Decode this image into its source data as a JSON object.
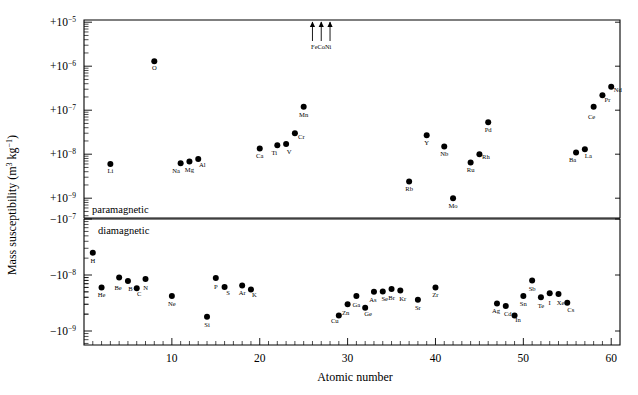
{
  "chart_data": {
    "type": "scatter",
    "title": "",
    "xlabel": "Atomic number",
    "ylabel": "Mass susceptibility (m^3 kg^-1)",
    "ylabel_parts": {
      "prefix": "Mass susceptibility (m",
      "sup1": "3",
      "mid": " kg",
      "sup2": "−1",
      "suffix": ")"
    },
    "xlim": [
      0,
      61
    ],
    "xticks": [
      10,
      20,
      30,
      40,
      50,
      60
    ],
    "xtick_labels": [
      "10",
      "20",
      "30",
      "40",
      "50",
      "60"
    ],
    "xminor_step": 1,
    "grid": false,
    "legend": null,
    "panels": [
      {
        "name": "paramagnetic",
        "label": "paramagnetic",
        "sign": "+",
        "yticks": [
          -5,
          -6,
          -7,
          -8,
          -9
        ],
        "ytick_labels": [
          "+10–5",
          "+10–6",
          "+10–7",
          "+10–8",
          "+10–9"
        ],
        "ytick_mantissas": [
          "+10",
          "+10",
          "+10",
          "+10",
          "+10"
        ],
        "ytick_exponents": [
          "−5",
          "−6",
          "−7",
          "−8",
          "−9"
        ],
        "ylim_log": [
          -9.45,
          -4.95
        ],
        "points": [
          {
            "label": "Li",
            "z": 3,
            "value": 6e-09,
            "lx": 0,
            "ly": 9
          },
          {
            "label": "O",
            "z": 8,
            "value": 1.3e-06,
            "lx": 0,
            "ly": 9
          },
          {
            "label": "Na",
            "z": 11,
            "value": 6.2e-09,
            "lx": -4.5,
            "ly": 10
          },
          {
            "label": "Mg",
            "z": 12,
            "value": 6.8e-09,
            "lx": 0,
            "ly": 10
          },
          {
            "label": "Al",
            "z": 13,
            "value": 7.8e-09,
            "lx": 4.0,
            "ly": 8
          },
          {
            "label": "Ca",
            "z": 20,
            "value": 1.35e-08,
            "lx": 0,
            "ly": 10
          },
          {
            "label": "Ti",
            "z": 22,
            "value": 1.6e-08,
            "lx": -3.0,
            "ly": 10
          },
          {
            "label": "V",
            "z": 23,
            "value": 1.7e-08,
            "lx": 3.0,
            "ly": 10
          },
          {
            "label": "Cr",
            "z": 24,
            "value": 3e-08,
            "lx": 6.5,
            "ly": 6
          },
          {
            "label": "Mn",
            "z": 25,
            "value": 1.2e-07,
            "lx": 0,
            "ly": 10
          },
          {
            "label": "Rb",
            "z": 37,
            "value": 2.4e-09,
            "lx": 0,
            "ly": 10
          },
          {
            "label": "Y",
            "z": 39,
            "value": 2.7e-08,
            "lx": 0,
            "ly": 10
          },
          {
            "label": "Nb",
            "z": 41,
            "value": 1.5e-08,
            "lx": 0,
            "ly": 10
          },
          {
            "label": "Mo",
            "z": 42,
            "value": 1e-09,
            "lx": 0,
            "ly": 10
          },
          {
            "label": "Ru",
            "z": 44,
            "value": 6.5e-09,
            "lx": 0,
            "ly": 10
          },
          {
            "label": "Rh",
            "z": 45,
            "value": 1e-08,
            "lx": 6.5,
            "ly": 5
          },
          {
            "label": "Pd",
            "z": 46,
            "value": 5.3e-08,
            "lx": 0,
            "ly": 10
          },
          {
            "label": "Ba",
            "z": 56,
            "value": 1.1e-08,
            "lx": -3.5,
            "ly": 10
          },
          {
            "label": "La",
            "z": 57,
            "value": 1.3e-08,
            "lx": 3.5,
            "ly": 9
          },
          {
            "label": "Ce",
            "z": 58,
            "value": 1.2e-07,
            "lx": -2.0,
            "ly": 12
          },
          {
            "label": "Pr",
            "z": 59,
            "value": 2.2e-07,
            "lx": 5.0,
            "ly": 7
          },
          {
            "label": "Nd",
            "z": 60,
            "value": 3.4e-07,
            "lx": 6.5,
            "ly": 5
          }
        ],
        "offscale_arrows": {
          "labels": [
            "Fe",
            "Co",
            "Ni"
          ],
          "z": [
            26,
            27,
            28
          ],
          "caption": "FeCoNi",
          "note": "ferromagnetic — off scale above"
        }
      },
      {
        "name": "diamagnetic",
        "label": "diamagnetic",
        "sign": "−",
        "yticks": [
          -9,
          -8,
          -7
        ],
        "ytick_labels": [
          "−10–9",
          "−10–8",
          "−10–7"
        ],
        "ytick_mantissas": [
          "−10",
          "−10",
          "−10"
        ],
        "ytick_exponents": [
          "−9",
          "−8",
          "−7"
        ],
        "ylim_log": [
          -9.25,
          -7.0
        ],
        "points": [
          {
            "label": "H",
            "z": 1,
            "value": -2.5e-08,
            "lx": 0,
            "ly": 10
          },
          {
            "label": "He",
            "z": 2,
            "value": -6e-09,
            "lx": 0,
            "ly": 10
          },
          {
            "label": "Be",
            "z": 4,
            "value": -9e-09,
            "lx": -1,
            "ly": 12
          },
          {
            "label": "B",
            "z": 5,
            "value": -7.8e-09,
            "lx": 2.5,
            "ly": 10
          },
          {
            "label": "C",
            "z": 6,
            "value": -5.8e-09,
            "lx": 2.5,
            "ly": 8
          },
          {
            "label": "N",
            "z": 7,
            "value": -8.5e-09,
            "lx": 0,
            "ly": 11
          },
          {
            "label": "Ne",
            "z": 10,
            "value": -4.2e-09,
            "lx": 0,
            "ly": 10
          },
          {
            "label": "Si",
            "z": 14,
            "value": -1.8e-09,
            "lx": 0,
            "ly": 10
          },
          {
            "label": "P",
            "z": 15,
            "value": -8.8e-09,
            "lx": 0,
            "ly": 11
          },
          {
            "label": "S",
            "z": 16,
            "value": -6.1e-09,
            "lx": 3.5,
            "ly": 8
          },
          {
            "label": "Ar",
            "z": 18,
            "value": -6.5e-09,
            "lx": 0,
            "ly": 10
          },
          {
            "label": "K",
            "z": 19,
            "value": -5.5e-09,
            "lx": 3.5,
            "ly": 7
          },
          {
            "label": "Cu",
            "z": 29,
            "value": -1.9e-09,
            "lx": -4,
            "ly": 8
          },
          {
            "label": "Zn",
            "z": 30,
            "value": -3e-09,
            "lx": -2,
            "ly": 11
          },
          {
            "label": "Ga",
            "z": 31,
            "value": -4.2e-09,
            "lx": 0,
            "ly": 11
          },
          {
            "label": "Ge",
            "z": 32,
            "value": -2.6e-09,
            "lx": 3.0,
            "ly": 8
          },
          {
            "label": "As",
            "z": 33,
            "value": -5e-09,
            "lx": -1,
            "ly": 10
          },
          {
            "label": "Se",
            "z": 34,
            "value": -5.1e-09,
            "lx": 2,
            "ly": 10
          },
          {
            "label": "Br",
            "z": 35,
            "value": -5.6e-09,
            "lx": 0,
            "ly": 11
          },
          {
            "label": "Kr",
            "z": 36,
            "value": -5.3e-09,
            "lx": 2.5,
            "ly": 11
          },
          {
            "label": "Sr",
            "z": 38,
            "value": -3.6e-09,
            "lx": 0,
            "ly": 10
          },
          {
            "label": "Zr",
            "z": 40,
            "value": -6e-09,
            "lx": 0,
            "ly": 10
          },
          {
            "label": "Ag",
            "z": 47,
            "value": -3.1e-09,
            "lx": -1,
            "ly": 10
          },
          {
            "label": "Cd",
            "z": 48,
            "value": -2.8e-09,
            "lx": 2,
            "ly": 10
          },
          {
            "label": "In",
            "z": 49,
            "value": -1.9e-09,
            "lx": 3.5,
            "ly": 7
          },
          {
            "label": "Sn",
            "z": 50,
            "value": -4.2e-09,
            "lx": 0,
            "ly": 10
          },
          {
            "label": "Sb",
            "z": 51,
            "value": -8e-09,
            "lx": 0,
            "ly": 11
          },
          {
            "label": "Te",
            "z": 52,
            "value": -4e-09,
            "lx": 0,
            "ly": 11
          },
          {
            "label": "I",
            "z": 53,
            "value": -4.7e-09,
            "lx": 0,
            "ly": 12
          },
          {
            "label": "Xe",
            "z": 54,
            "value": -4.6e-09,
            "lx": 2,
            "ly": 11
          },
          {
            "label": "Cs",
            "z": 55,
            "value": -3.2e-09,
            "lx": 3.5,
            "ly": 9
          }
        ]
      }
    ]
  },
  "colors": {
    "axis": "#000000",
    "point": "#000000",
    "background": "#ffffff"
  }
}
